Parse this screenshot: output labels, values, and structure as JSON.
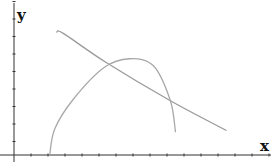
{
  "chart_data": {
    "type": "line",
    "title": "",
    "xlabel": "x",
    "ylabel": "y",
    "grid": false,
    "legend": null,
    "x_ticks_count": 16,
    "y_ticks_count": 9,
    "xlim": [
      -0.8,
      14.9
    ],
    "ylim": [
      0,
      8.7
    ],
    "series": [
      {
        "name": "decreasing-line",
        "color": "#9a9a9a",
        "points": [
          [
            2.5,
            7.0
          ],
          [
            2.9,
            6.95
          ],
          [
            5.4,
            5.3
          ],
          [
            9.2,
            3.1
          ],
          [
            12.5,
            1.4
          ]
        ]
      },
      {
        "name": "arc-curve",
        "color": "#a8a8a8",
        "points": [
          [
            2.1,
            0.0
          ],
          [
            2.4,
            1.5
          ],
          [
            3.5,
            3.2
          ],
          [
            5.3,
            5.0
          ],
          [
            6.8,
            5.5
          ],
          [
            8.2,
            5.1
          ],
          [
            9.2,
            3.1
          ],
          [
            9.5,
            1.3
          ]
        ]
      }
    ],
    "annotations": []
  },
  "axes": {
    "x_label": "x",
    "y_label": "y"
  }
}
